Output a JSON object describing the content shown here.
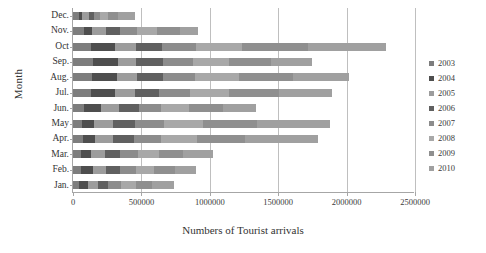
{
  "chart_data": {
    "type": "bar",
    "orientation": "horizontal",
    "stacked": true,
    "title": "",
    "xlabel": "Numbers of Tourist arrivals",
    "ylabel": "Month",
    "xlim": [
      0,
      2500000
    ],
    "xticks": [
      0,
      500000,
      1000000,
      1500000,
      2000000,
      2500000
    ],
    "xtick_labels": [
      "0",
      "500000",
      "1000000",
      "1500000",
      "2000000",
      "2500000"
    ],
    "grid": "vertical",
    "legend_position": "right",
    "categories": [
      "Dec.",
      "Nov.",
      "Oct",
      "Sep.",
      "Aug.",
      "Jul.",
      "Jun.",
      "May",
      "Apr.",
      "Mar.",
      "Feb.",
      "Jan."
    ],
    "series": [
      {
        "name": "2003",
        "color": "#7d7d7d",
        "values": [
          44000,
          78000,
          130000,
          146000,
          137000,
          132000,
          78000,
          65000,
          70000,
          57000,
          62000,
          46000
        ]
      },
      {
        "name": "2004",
        "color": "#4e4e4e",
        "values": [
          22000,
          62000,
          180000,
          186000,
          183000,
          176000,
          126000,
          85000,
          94000,
          78000,
          81000,
          62000
        ]
      },
      {
        "name": "2005",
        "color": "#9c9c9c",
        "values": [
          52000,
          104000,
          151000,
          132000,
          150000,
          142000,
          130000,
          146000,
          128000,
          101000,
          96000,
          73000
        ]
      },
      {
        "name": "2006",
        "color": "#606060",
        "values": [
          32000,
          101000,
          193000,
          196000,
          190000,
          180000,
          145000,
          158000,
          152000,
          109000,
          103000,
          78000
        ]
      },
      {
        "name": "2007",
        "color": "#8c8c8c",
        "values": [
          44000,
          120000,
          243000,
          216000,
          232000,
          222000,
          166000,
          210000,
          196000,
          129000,
          118000,
          92000
        ]
      },
      {
        "name": "2008",
        "color": "#a8a8a8",
        "values": [
          64000,
          152000,
          340000,
          262000,
          318000,
          290000,
          205000,
          288000,
          265000,
          158000,
          136000,
          110000
        ]
      },
      {
        "name": "2009",
        "color": "#8f8f8f",
        "values": [
          68000,
          166000,
          480000,
          310000,
          398000,
          362000,
          250000,
          390000,
          356000,
          174000,
          148000,
          118000
        ]
      },
      {
        "name": "2010",
        "color": "#a0a0a0",
        "values": [
          130000,
          132000,
          573000,
          297000,
          407000,
          391000,
          235000,
          534000,
          529000,
          219000,
          159000,
          160000
        ]
      }
    ],
    "totals": [
      456000,
      915000,
      2290000,
      1745000,
      2015000,
      1895000,
      1335000,
      1876000,
      1790000,
      1025000,
      903000,
      739000
    ]
  },
  "legend": {
    "items": [
      {
        "label": "2003"
      },
      {
        "label": "2004"
      },
      {
        "label": "2005"
      },
      {
        "label": "2006"
      },
      {
        "label": "2007"
      },
      {
        "label": "2008"
      },
      {
        "label": "2009"
      },
      {
        "label": "2010"
      }
    ]
  },
  "axes": {
    "y_title": "Month",
    "x_title": "Numbers of Tourist arrivals"
  }
}
